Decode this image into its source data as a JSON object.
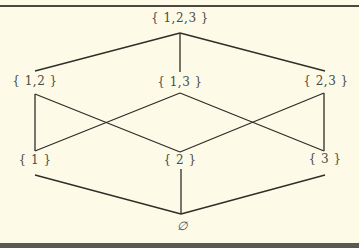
{
  "diagram": {
    "type": "hasse-diagram",
    "colors": {
      "background": "#fdfbe8",
      "line": "#2e2d28",
      "text": "#4b4a44",
      "frame": "#4a4840"
    },
    "nodes": {
      "top": {
        "label": "{ 1,2,3 }",
        "x": 180,
        "y": 18
      },
      "n12": {
        "label": "{ 1,2 }",
        "x": 35,
        "y": 81
      },
      "n13": {
        "label": "{ 1,3 }",
        "x": 180,
        "y": 81
      },
      "n23": {
        "label": "{ 2,3 }",
        "x": 326,
        "y": 81
      },
      "n1": {
        "label": "{ 1 }",
        "x": 35,
        "y": 157
      },
      "n2": {
        "label": "{ 2 }",
        "x": 180,
        "y": 157
      },
      "n3": {
        "label": "{ 3 }",
        "x": 325,
        "y": 157
      },
      "bottom": {
        "label": "∅",
        "x": 182,
        "y": 226
      }
    },
    "edges": [
      [
        "{1,2,3}",
        "{1,2}"
      ],
      [
        "{1,2,3}",
        "{1,3}"
      ],
      [
        "{1,2,3}",
        "{2,3}"
      ],
      [
        "{1,2}",
        "{1}"
      ],
      [
        "{1,2}",
        "{2}"
      ],
      [
        "{1,3}",
        "{1}"
      ],
      [
        "{1,3}",
        "{3}"
      ],
      [
        "{2,3}",
        "{2}"
      ],
      [
        "{2,3}",
        "{3}"
      ],
      [
        "{1}",
        "∅"
      ],
      [
        "{2}",
        "∅"
      ],
      [
        "{3}",
        "∅"
      ]
    ]
  }
}
